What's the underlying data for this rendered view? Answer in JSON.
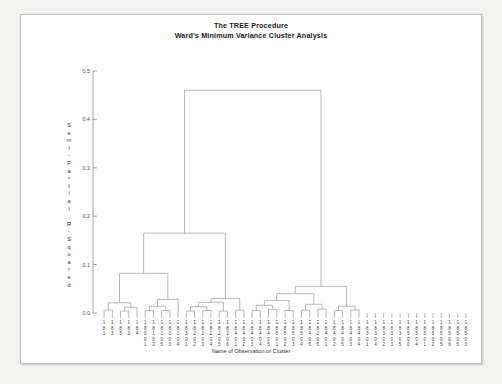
{
  "window": {
    "background_color": "#f2f2f0",
    "panel_color": "#ffffff",
    "border_color": "#bdbdbd"
  },
  "header": {
    "title_line_1": "The TREE Procedure",
    "title_line_2": "Ward's Minimum Variance Cluster Analysis"
  },
  "axes": {
    "y_axis_title": "Semi-Partial R-Squared",
    "x_axis_title": "Name of Observation or Cluster",
    "y_ticks": [
      "0.0",
      "0.1",
      "0.2",
      "0.3",
      "0.4",
      "0.5"
    ],
    "y_min": 0.0,
    "y_max": 0.5
  },
  "chart_data": {
    "type": "line",
    "title": "Ward's Minimum Variance Cluster Analysis",
    "subtitle": "The TREE Procedure",
    "xlabel": "Name of Observation or Cluster",
    "ylabel": "Semi-Partial R-Squared",
    "ylim": [
      0.0,
      0.5
    ],
    "grid": false,
    "legend": "none",
    "chart_kind": "dendrogram",
    "linkage_method": "ward",
    "leaf_count": 45,
    "leaf_labels": [
      "1181",
      "1183",
      "1185",
      "1182",
      "1184",
      "18001",
      "18102",
      "18105",
      "18003",
      "18104",
      "18301",
      "18202",
      "18203",
      "18204",
      "18205",
      "18206",
      "18401",
      "18402",
      "18403",
      "18404",
      "18405",
      "18501",
      "18502",
      "18503",
      "18504",
      "18405b",
      "18301c",
      "18302",
      "18304",
      "18303",
      "18305",
      "18504b",
      "18401d",
      "18402e",
      "18403f",
      "18305g",
      "18501h",
      "18502i",
      "18503j",
      "18504k",
      "18505",
      "18501m",
      "18502n",
      "18505o",
      "18503p"
    ],
    "leaf_labels_display": [
      [
        "1",
        "8",
        "1"
      ],
      [
        "1",
        "8",
        "3"
      ],
      [
        "1",
        "8",
        "5"
      ],
      [
        "1",
        "8",
        "2"
      ],
      [
        "1",
        "8",
        "4"
      ],
      [
        "1",
        "8",
        "0",
        "0",
        "1"
      ],
      [
        "1",
        "8",
        "1",
        "0",
        "2"
      ],
      [
        "1",
        "8",
        "1",
        "0",
        "5"
      ],
      [
        "1",
        "8",
        "0",
        "0",
        "3"
      ],
      [
        "1",
        "8",
        "1",
        "0",
        "4"
      ],
      [
        "1",
        "8",
        "3",
        "0",
        "1"
      ],
      [
        "1",
        "8",
        "2",
        "0",
        "2"
      ],
      [
        "1",
        "8",
        "2",
        "0",
        "3"
      ],
      [
        "1",
        "8",
        "2",
        "0",
        "4"
      ],
      [
        "1",
        "8",
        "2",
        "0",
        "5"
      ],
      [
        "1",
        "8",
        "2",
        "0",
        "6"
      ],
      [
        "1",
        "8",
        "4",
        "0",
        "1"
      ],
      [
        "1",
        "8",
        "4",
        "0",
        "2"
      ],
      [
        "1",
        "8",
        "4",
        "0",
        "3"
      ],
      [
        "1",
        "8",
        "4",
        "0",
        "4"
      ],
      [
        "1",
        "8",
        "4",
        "0",
        "5"
      ],
      [
        "1",
        "8",
        "5",
        "0",
        "1"
      ],
      [
        "1",
        "8",
        "5",
        "0",
        "2"
      ],
      [
        "1",
        "8",
        "5",
        "0",
        "3"
      ],
      [
        "1",
        "8",
        "5",
        "0",
        "4"
      ],
      [
        "1",
        "8",
        "4",
        "0",
        "5"
      ],
      [
        "1",
        "8",
        "2",
        "0",
        "5"
      ],
      [
        "1",
        "8",
        "4",
        "0",
        "1"
      ],
      [
        "1",
        "8",
        "4",
        "0",
        "2"
      ],
      [
        "1",
        "8",
        "4",
        "0",
        "5"
      ],
      [
        "1",
        "8",
        "4",
        "0",
        "3"
      ],
      [
        "1",
        "8",
        "4",
        "0",
        "4"
      ],
      [
        "1",
        "8",
        "3",
        "0",
        "1"
      ],
      [
        "1",
        "8",
        "3",
        "0",
        "4"
      ],
      [
        "1",
        "8",
        "3",
        "0",
        "2"
      ],
      [
        "1",
        "8",
        "3",
        "0",
        "3"
      ],
      [
        "1",
        "8",
        "3",
        "0",
        "5"
      ],
      [
        "1",
        "8",
        "5",
        "0",
        "0"
      ],
      [
        "1",
        "8",
        "5",
        "0",
        "4"
      ],
      [
        "1",
        "8",
        "5",
        "0",
        "1"
      ],
      [
        "1",
        "8",
        "5",
        "0",
        "2"
      ],
      [
        "1",
        "8",
        "5",
        "0",
        "5"
      ],
      [
        "1",
        "8",
        "5",
        "0",
        "6"
      ],
      [
        "1",
        "8",
        "5",
        "0",
        "5"
      ],
      [
        "1",
        "8",
        "5",
        "0",
        "3"
      ]
    ],
    "merges": [
      {
        "left": 0,
        "right": 1,
        "height": 0.006
      },
      {
        "left": 2,
        "right": 3,
        "height": 0.004
      },
      {
        "left": 46,
        "right": 4,
        "height": 0.012
      },
      {
        "left": 45,
        "right": 47,
        "height": 0.021
      },
      {
        "left": 5,
        "right": 6,
        "height": 0.005
      },
      {
        "left": 7,
        "right": 8,
        "height": 0.005
      },
      {
        "left": 49,
        "right": 50,
        "height": 0.014
      },
      {
        "left": 51,
        "right": 9,
        "height": 0.028
      },
      {
        "left": 48,
        "right": 52,
        "height": 0.082
      },
      {
        "left": 10,
        "right": 11,
        "height": 0.004
      },
      {
        "left": 12,
        "right": 13,
        "height": 0.005
      },
      {
        "left": 54,
        "right": 55,
        "height": 0.013
      },
      {
        "left": 14,
        "right": 15,
        "height": 0.004
      },
      {
        "left": 56,
        "right": 57,
        "height": 0.022
      },
      {
        "left": 16,
        "right": 17,
        "height": 0.006
      },
      {
        "left": 58,
        "right": 59,
        "height": 0.03
      },
      {
        "left": 53,
        "right": 60,
        "height": 0.165
      },
      {
        "left": 18,
        "right": 19,
        "height": 0.005
      },
      {
        "left": 20,
        "right": 21,
        "height": 0.007
      },
      {
        "left": 62,
        "right": 63,
        "height": 0.016
      },
      {
        "left": 22,
        "right": 23,
        "height": 0.005
      },
      {
        "left": 64,
        "right": 65,
        "height": 0.026
      },
      {
        "left": 24,
        "right": 25,
        "height": 0.006
      },
      {
        "left": 26,
        "right": 27,
        "height": 0.008
      },
      {
        "left": 67,
        "right": 68,
        "height": 0.018
      },
      {
        "left": 66,
        "right": 69,
        "height": 0.04
      },
      {
        "left": 28,
        "right": 29,
        "height": 0.005
      },
      {
        "left": 30,
        "right": 31,
        "height": 0.006
      },
      {
        "left": 71,
        "right": 72,
        "height": 0.014
      },
      {
        "left": 70,
        "right": 73,
        "height": 0.055
      },
      {
        "left": 61,
        "right": 74,
        "height": 0.46
      }
    ],
    "root_height": 0.46,
    "major_split_heights": [
      0.46,
      0.165,
      0.082,
      0.055
    ],
    "line_color": "#9a9a9a",
    "axis_color": "#8a8a8a"
  }
}
